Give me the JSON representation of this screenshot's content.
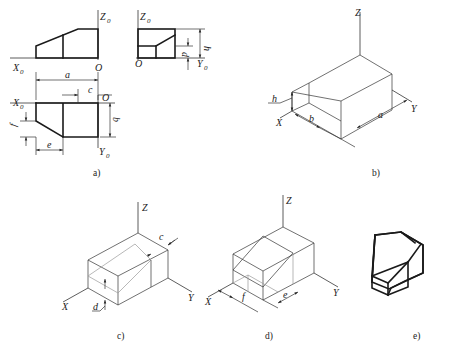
{
  "figure": {
    "panels": [
      {
        "id": "a",
        "caption": "a)",
        "description": "Three-view orthographic projection with axes and dimensions",
        "front_view": {
          "axis_labels": {
            "z": "Z",
            "z_sub": "0",
            "x": "X",
            "x_sub": "0",
            "origin": "O"
          }
        },
        "side_view": {
          "axis_labels": {
            "z": "Z",
            "z_sub": "0",
            "y": "Y",
            "y_sub": "0",
            "origin": "O"
          },
          "dimensions": [
            "h",
            "d"
          ]
        },
        "top_view": {
          "axis_labels": {
            "x": "X",
            "x_sub": "0",
            "y": "Y",
            "y_sub": "0",
            "origin": "O"
          },
          "dimensions": [
            "a",
            "c",
            "b",
            "f",
            "e"
          ]
        }
      },
      {
        "id": "b",
        "caption": "b)",
        "description": "Axonometric bounding box with dimensions a, b, h",
        "axis_labels": {
          "z": "Z",
          "x": "X",
          "y": "Y"
        },
        "dimensions": [
          "h",
          "b",
          "a"
        ]
      },
      {
        "id": "c",
        "caption": "c)",
        "description": "Box with cut lines located by dimensions c and d",
        "axis_labels": {
          "z": "Z",
          "x": "X",
          "y": "Y"
        },
        "dimensions": [
          "c",
          "d"
        ]
      },
      {
        "id": "d",
        "caption": "d)",
        "description": "Box with inclined cut located by dimensions f and e",
        "axis_labels": {
          "z": "Z",
          "x": "X",
          "y": "Y"
        },
        "dimensions": [
          "f",
          "e"
        ]
      },
      {
        "id": "e",
        "caption": "e)",
        "description": "Final axonometric drawing of the solid"
      }
    ]
  },
  "labels": {
    "Z": "Z",
    "X": "X",
    "Y": "Y",
    "O": "O",
    "sub0": "0",
    "a": "a",
    "b": "b",
    "c": "c",
    "d": "d",
    "e": "e",
    "f": "f",
    "h": "h",
    "cap_a": "a)",
    "cap_b": "b)",
    "cap_c": "c)",
    "cap_d": "d)",
    "cap_e": "e)"
  }
}
